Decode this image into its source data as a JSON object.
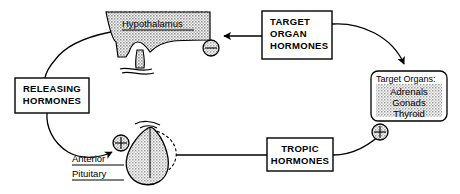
{
  "diagram": {
    "type": "flow-feedback-loop",
    "canvas": {
      "width": 460,
      "height": 194
    },
    "colors": {
      "stroke": "#000000",
      "background": "#ffffff",
      "tissue_fill": "#bdbdbd",
      "organ_box_fill": "#c9c9c9",
      "box_fill": "#ffffff"
    },
    "boxes": [
      {
        "id": "releasing-hormones",
        "lines": [
          "RELEASING",
          "HORMONES"
        ],
        "x": 15,
        "y": 78,
        "w": 74,
        "h": 35,
        "style": "rect"
      },
      {
        "id": "target-organ-hormones",
        "lines": [
          "TARGET",
          "ORGAN",
          "HORMONES"
        ],
        "x": 262,
        "y": 11,
        "w": 70,
        "h": 48,
        "style": "rect"
      },
      {
        "id": "tropic-hormones",
        "lines": [
          "TROPIC",
          "HORMONES"
        ],
        "x": 267,
        "y": 138,
        "w": 66,
        "h": 33,
        "style": "rect"
      }
    ],
    "organ_box": {
      "id": "target-organs",
      "title": "Target Organs:",
      "items": [
        "Adrenals",
        "Gonads",
        "Thyroid"
      ],
      "x": 371,
      "y": 71,
      "w": 76,
      "h": 50,
      "style": "rounded-shaded"
    },
    "anatomy": [
      {
        "id": "hypothalamus",
        "label": "Hypothalamus",
        "underlined": true,
        "fill": "shaded",
        "label_x": 122,
        "label_y": 25
      },
      {
        "id": "anterior-pituitary",
        "label_lines": [
          "Anterior",
          "Pituitary"
        ],
        "underlined": true,
        "fill": "shaded",
        "label_x": 72,
        "label_y": 163
      },
      {
        "id": "posterior-pituitary",
        "label": "",
        "fill": "dashed-outline"
      }
    ],
    "signs": [
      {
        "id": "negative-feedback-hypothalamus",
        "symbol": "minus",
        "x": 211,
        "y": 48,
        "r": 8
      },
      {
        "id": "positive-stimulus-pituitary",
        "symbol": "plus",
        "x": 121,
        "y": 143,
        "r": 8
      },
      {
        "id": "positive-stimulus-target-organs",
        "symbol": "plus",
        "x": 380,
        "y": 132,
        "r": 8
      }
    ],
    "arrows": [
      {
        "id": "hypothalamus-to-releasing-hormones",
        "from": "hypothalamus",
        "to": "releasing-hormones"
      },
      {
        "id": "releasing-hormones-to-pituitary",
        "from": "releasing-hormones",
        "to": "anterior-pituitary",
        "sign": "plus"
      },
      {
        "id": "pituitary-to-tropic-hormones",
        "from": "anterior-pituitary",
        "to": "tropic-hormones"
      },
      {
        "id": "tropic-hormones-to-target-organs",
        "from": "tropic-hormones",
        "to": "target-organs",
        "sign": "plus"
      },
      {
        "id": "target-organs-to-target-organ-hormones",
        "from": "target-organs",
        "to": "target-organ-hormones"
      },
      {
        "id": "target-organ-hormones-to-hypothalamus",
        "from": "target-organ-hormones",
        "to": "hypothalamus",
        "sign": "minus"
      }
    ]
  }
}
